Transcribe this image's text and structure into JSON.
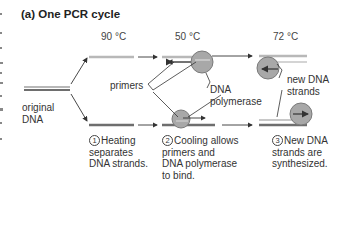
{
  "title": "(a) One PCR cycle",
  "temperatures": [
    "90 °C",
    "50 °C",
    "72 °C"
  ],
  "labels": {
    "original_dna_line1": "original",
    "original_dna_line2": "DNA",
    "primers": "primers",
    "dna_polymerase_line1": "DNA",
    "dna_polymerase_line2": "polymerase",
    "new_strands_line1": "new DNA",
    "new_strands_line2": "strands"
  },
  "steps": [
    {
      "number": "1",
      "lines": [
        "Heating",
        "separates",
        "DNA strands."
      ]
    },
    {
      "number": "2",
      "lines": [
        "Cooling allows",
        "primers and",
        "DNA polymerase",
        "to bind."
      ]
    },
    {
      "number": "3",
      "lines": [
        "New DNA",
        "strands are",
        "synthesized."
      ]
    }
  ],
  "colors": {
    "strand_dark": "#6e6e6e",
    "strand_light": "#b8b8b8",
    "polymerase_fill": "#a8a8a8",
    "polymerase_stroke": "#7a7a7a",
    "arrow": "#333333"
  }
}
